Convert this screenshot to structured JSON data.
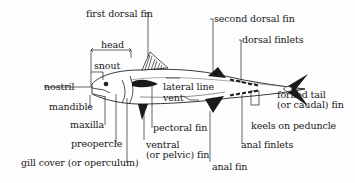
{
  "diagram": {
    "labels": {
      "first_dorsal_fin": "first dorsal fin",
      "head": "head",
      "snout": "snout",
      "nostril": "nostril",
      "mandible": "mandible",
      "maxilla": "maxilla",
      "preopercle": "preopercle",
      "gill_cover": "gill cover (or operculum)",
      "lateral_line": "lateral line",
      "vent": "vent",
      "pectoral_fin": "pectoral fin",
      "ventral_fin_1": "ventral",
      "ventral_fin_2": "(or pelvic) fin",
      "anal_fin": "anal fin",
      "anal_finlets": "anal finlets",
      "second_dorsal_fin": "second dorsal fin",
      "dorsal_finlets": "dorsal finlets",
      "forked_tail_1": "forked tail",
      "forked_tail_2": "(or caudal) fin",
      "keels_on_peduncle": "keels on peduncle"
    }
  }
}
